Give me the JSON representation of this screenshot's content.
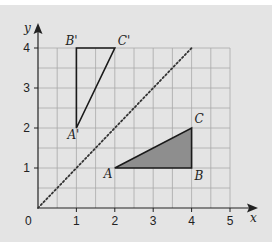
{
  "figure": {
    "axes": {
      "x_label": "x",
      "y_label": "y",
      "origin_label": "0",
      "x_ticks": [
        "1",
        "2",
        "3",
        "4",
        "5"
      ],
      "y_ticks": [
        "1",
        "2",
        "3",
        "4"
      ],
      "x_range": [
        0,
        5
      ],
      "y_range": [
        0,
        4
      ],
      "grid_step_minor": 0.5
    },
    "triangle_original": {
      "name": "ABC",
      "filled": true,
      "fill_color": "#8e8e8e",
      "vertices": [
        {
          "label": "A",
          "x": 2,
          "y": 1
        },
        {
          "label": "B",
          "x": 4,
          "y": 1
        },
        {
          "label": "C",
          "x": 4,
          "y": 2
        }
      ]
    },
    "triangle_image": {
      "name": "A'B'C'",
      "filled": false,
      "vertices": [
        {
          "label": "A'",
          "x": 1,
          "y": 2
        },
        {
          "label": "B'",
          "x": 1,
          "y": 4
        },
        {
          "label": "C'",
          "x": 2,
          "y": 4
        }
      ]
    },
    "mirror_line": {
      "equation": "y = x",
      "style": "dotted",
      "from": [
        0,
        0
      ],
      "to": [
        4,
        4
      ]
    },
    "colors": {
      "background": "#e4e4e4",
      "grid": "#a8a8a8",
      "axis": "#222222",
      "fill": "#8e8e8e"
    }
  }
}
